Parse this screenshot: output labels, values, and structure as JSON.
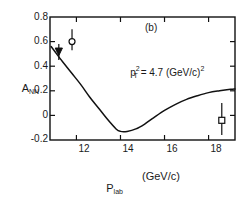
{
  "chart_data": {
    "type": "line",
    "title": "",
    "panel_label": "(b)",
    "xlabel_main": "P",
    "xlabel_sub": "lab",
    "xlabel_units": "(GeV/c)",
    "ylabel_main": "A",
    "ylabel_sub": "NN",
    "annotation": {
      "base": "p",
      "sub": "T",
      "sup": "2",
      "equals": " = 4.7 (GeV/c)",
      "tail_sup": "2"
    },
    "xlim": [
      10.8,
      19.2
    ],
    "ylim": [
      -0.2,
      0.8
    ],
    "xticks": [
      12,
      14,
      16,
      18
    ],
    "xtick_labels": [
      "12",
      "14",
      "16",
      "18"
    ],
    "yticks": [
      -0.2,
      0,
      0.2,
      0.4,
      0.6,
      0.8
    ],
    "ytick_labels": [
      "-0.2",
      "0",
      "0.2",
      "0.4",
      "0.6",
      "0.8"
    ],
    "grid": false,
    "legend": "none",
    "series": [
      {
        "name": "theory-curve",
        "type": "line",
        "color": "#000000",
        "x": [
          10.85,
          11.1,
          11.4,
          11.8,
          12.2,
          12.6,
          13.0,
          13.4,
          13.8,
          14.0,
          14.3,
          14.7,
          15.1,
          15.5,
          16.0,
          16.5,
          17.0,
          17.5,
          18.0,
          18.5,
          19.0,
          19.2
        ],
        "y": [
          0.56,
          0.5,
          0.43,
          0.34,
          0.25,
          0.15,
          0.06,
          -0.03,
          -0.11,
          -0.13,
          -0.13,
          -0.11,
          -0.07,
          -0.02,
          0.04,
          0.09,
          0.13,
          0.16,
          0.185,
          0.2,
          0.212,
          0.215
        ]
      },
      {
        "name": "data-points",
        "type": "scatter",
        "points": [
          {
            "marker": "filled-triangle",
            "x": 11.2,
            "y": 0.52,
            "yerr_low": 0.07,
            "yerr_high": 0.06
          },
          {
            "marker": "open-circle",
            "x": 11.8,
            "y": 0.6,
            "yerr_low": 0.07,
            "yerr_high": 0.1
          },
          {
            "marker": "open-square",
            "x": 18.6,
            "y": -0.04,
            "yerr_low": 0.12,
            "yerr_high": 0.14
          }
        ]
      }
    ]
  }
}
